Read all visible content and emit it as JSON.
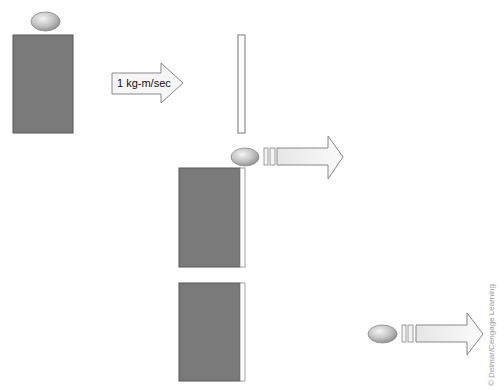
{
  "diagram": {
    "arrow_label": "1 kg-m/sec",
    "credit": "© Delmar/Cengage Learning",
    "colors": {
      "block_fill": "#7a7a7a",
      "block_border": "#555555",
      "slab_fill": "#ffffff",
      "slab_border": "#777777",
      "ball_light": "#f0f0f0",
      "ball_dark": "#8c8c8c",
      "arrow_fill": "#f7f7f7",
      "arrow_border": "#888888"
    },
    "stages": [
      {
        "name": "before",
        "description": "ball resting on block, momentum arrow toward slab"
      },
      {
        "name": "collision",
        "description": "ball moving away from block with slab attached"
      },
      {
        "name": "after",
        "description": "ball moving right, block remains"
      }
    ]
  }
}
